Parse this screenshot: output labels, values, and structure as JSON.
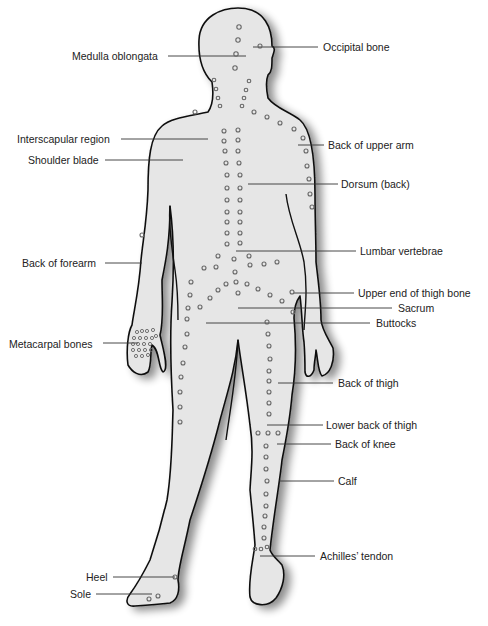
{
  "colors": {
    "body_fill": "#e6e6e6",
    "outline": "#111111",
    "point": "#666666",
    "leader": "#333333"
  },
  "labels": [
    {
      "id": "medulla-oblongata",
      "text": "Medulla oblongata",
      "x": 72,
      "y": 52,
      "side": "left",
      "line": [
        168,
        56,
        246,
        56
      ]
    },
    {
      "id": "occipital-bone",
      "text": "Occipital bone",
      "x": 324,
      "y": 41,
      "side": "right",
      "line": [
        253,
        47,
        318,
        47
      ]
    },
    {
      "id": "interscapular-region",
      "text": "Interscapular region",
      "x": 17,
      "y": 133,
      "side": "left",
      "line": [
        121,
        139,
        208,
        139
      ]
    },
    {
      "id": "shoulder-blade",
      "text": "Shoulder blade",
      "x": 28,
      "y": 155,
      "side": "left",
      "line": [
        105,
        160,
        183,
        160
      ]
    },
    {
      "id": "back-of-upper-arm",
      "text": "Back of upper arm",
      "x": 328,
      "y": 140,
      "side": "right",
      "line": [
        298,
        145,
        324,
        145
      ]
    },
    {
      "id": "dorsum-back",
      "text": "Dorsum (back)",
      "x": 341,
      "y": 179,
      "side": "right",
      "line": [
        248,
        184,
        338,
        184
      ]
    },
    {
      "id": "lumbar-vertebrae",
      "text": "Lumbar vertebrae",
      "x": 360,
      "y": 245,
      "side": "right",
      "line": [
        236,
        251,
        356,
        251
      ]
    },
    {
      "id": "back-of-forearm",
      "text": "Back of forearm",
      "x": 22,
      "y": 258,
      "side": "left",
      "line": [
        105,
        263,
        142,
        263
      ]
    },
    {
      "id": "upper-end-of-thigh-bone",
      "text": "Upper end of thigh bone",
      "x": 358,
      "y": 287,
      "side": "right",
      "line": [
        294,
        293,
        354,
        293
      ]
    },
    {
      "id": "sacrum",
      "text": "Sacrum",
      "x": 398,
      "y": 302,
      "side": "right",
      "line": [
        238,
        308,
        392,
        308
      ]
    },
    {
      "id": "buttocks",
      "text": "Buttocks",
      "x": 376,
      "y": 317,
      "side": "right",
      "line": [
        206,
        323,
        370,
        323
      ]
    },
    {
      "id": "metacarpal-bones",
      "text": "Metacarpal bones",
      "x": 9,
      "y": 338,
      "side": "left",
      "line": [
        103,
        343,
        138,
        343
      ]
    },
    {
      "id": "back-of-thigh",
      "text": "Back of thigh",
      "x": 338,
      "y": 376,
      "side": "right",
      "line": [
        278,
        383,
        333,
        383
      ]
    },
    {
      "id": "lower-back-of-thigh",
      "text": "Lower back of thigh",
      "x": 326,
      "y": 419,
      "side": "right",
      "line": [
        267,
        425,
        323,
        425
      ]
    },
    {
      "id": "back-of-knee",
      "text": "Back of knee",
      "x": 335,
      "y": 437,
      "side": "right",
      "line": [
        277,
        444,
        331,
        444
      ]
    },
    {
      "id": "calf",
      "text": "Calf",
      "x": 338,
      "y": 475,
      "side": "right",
      "line": [
        279,
        481,
        334,
        481
      ]
    },
    {
      "id": "achilles-tendon",
      "text": "Achilles’ tendon",
      "x": 320,
      "y": 550,
      "side": "right",
      "line": [
        260,
        556,
        315,
        556
      ]
    },
    {
      "id": "heel",
      "text": "Heel",
      "x": 86,
      "y": 571,
      "side": "left",
      "line": [
        113,
        577,
        175,
        577
      ]
    },
    {
      "id": "sole",
      "text": "Sole",
      "x": 70,
      "y": 589,
      "side": "left",
      "line": [
        96,
        594,
        152,
        594
      ]
    }
  ]
}
